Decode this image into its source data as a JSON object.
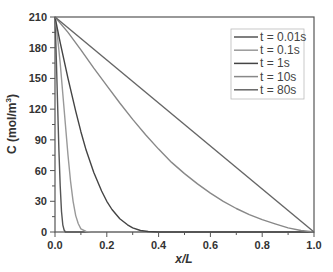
{
  "chart_data": {
    "type": "line",
    "title": "",
    "xlabel": "x/L",
    "ylabel": "C (mol/m³)",
    "xlim": [
      0,
      1.0
    ],
    "ylim": [
      0,
      210
    ],
    "xticks": [
      0.0,
      0.2,
      0.4,
      0.6,
      0.8,
      1.0
    ],
    "xtick_labels": [
      "0.0",
      "0.2",
      "0.4",
      "0.6",
      "0.8",
      "1.0"
    ],
    "yticks": [
      0,
      30,
      60,
      90,
      120,
      150,
      180,
      210
    ],
    "ytick_labels": [
      "0",
      "30",
      "60",
      "90",
      "120",
      "150",
      "180",
      "210"
    ],
    "grid": false,
    "legend_position": "upper right",
    "series": [
      {
        "name": "t = 0.01s",
        "color": "#555555",
        "x": [
          0,
          0.005,
          0.01,
          0.015,
          0.02,
          0.025,
          0.03,
          0.035,
          0.04,
          0.05,
          1.0
        ],
        "y": [
          210,
          170,
          125,
          80,
          45,
          20,
          7,
          2,
          0,
          0,
          0
        ]
      },
      {
        "name": "t = 0.1s",
        "color": "#999999",
        "x": [
          0,
          0.01,
          0.02,
          0.03,
          0.04,
          0.05,
          0.06,
          0.07,
          0.08,
          0.09,
          0.1,
          0.12,
          0.14,
          1.0
        ],
        "y": [
          210,
          190,
          165,
          135,
          105,
          75,
          50,
          30,
          16,
          8,
          3,
          0.5,
          0,
          0
        ]
      },
      {
        "name": "t = 1s",
        "color": "#444444",
        "x": [
          0,
          0.02,
          0.05,
          0.08,
          0.1,
          0.12,
          0.15,
          0.18,
          0.2,
          0.22,
          0.25,
          0.28,
          0.3,
          0.33,
          0.36,
          0.4,
          0.45,
          1.0
        ],
        "y": [
          210,
          185,
          150,
          118,
          98,
          80,
          58,
          40,
          30,
          22,
          13,
          7,
          4,
          1.5,
          0.5,
          0,
          0,
          0
        ]
      },
      {
        "name": "t = 10s",
        "color": "#888888",
        "x": [
          0,
          0.05,
          0.1,
          0.15,
          0.2,
          0.25,
          0.3,
          0.35,
          0.4,
          0.45,
          0.5,
          0.55,
          0.6,
          0.65,
          0.7,
          0.75,
          0.8,
          0.85,
          0.9,
          0.95,
          1.0
        ],
        "y": [
          210,
          195,
          178,
          160,
          143,
          126,
          110,
          95,
          81,
          68,
          57,
          47,
          38,
          30,
          23,
          17,
          12,
          8,
          4,
          1.5,
          0
        ]
      },
      {
        "name": "t = 80s",
        "color": "#666666",
        "x": [
          0,
          1.0
        ],
        "y": [
          210,
          0
        ]
      }
    ]
  },
  "legend": {
    "items": [
      {
        "label": "t = 0.01s",
        "color": "#555555"
      },
      {
        "label": "t = 0.1s",
        "color": "#999999"
      },
      {
        "label": "t = 1s",
        "color": "#444444"
      },
      {
        "label": "t = 10s",
        "color": "#888888"
      },
      {
        "label": "t = 80s",
        "color": "#666666"
      }
    ]
  },
  "axes": {
    "xlabel": "x/L",
    "ylabel_main": "C (mol/m",
    "ylabel_sup": "3",
    "ylabel_end": ")"
  }
}
